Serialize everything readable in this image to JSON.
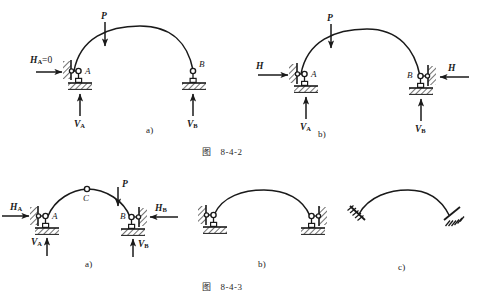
{
  "page": {
    "kind": "engineering-diagram",
    "topic": "arch support reactions",
    "width": 477,
    "height": 299,
    "background": "#ffffff",
    "ink_color": "#1a1a1a"
  },
  "figure_8_4_2": {
    "caption_prefix": "图",
    "caption_number": "8-4-2",
    "panels": [
      {
        "key": "a",
        "panel_label": "a)",
        "description": "two-hinged arch, left support with zero horizontal reaction",
        "load_label": "P",
        "nodes": [
          {
            "name": "A",
            "label": "A"
          },
          {
            "name": "B",
            "label": "B"
          }
        ],
        "reactions": [
          {
            "name": "H_A",
            "base": "H",
            "sub": "A",
            "suffix": "=0",
            "direction": "right"
          },
          {
            "name": "V_A",
            "base": "V",
            "sub": "A",
            "suffix": "",
            "direction": "up"
          },
          {
            "name": "V_B",
            "base": "V",
            "sub": "B",
            "suffix": "",
            "direction": "up"
          }
        ]
      },
      {
        "key": "b",
        "panel_label": "b)",
        "description": "two-hinged arch with horizontal thrust H applied at both abutments",
        "load_label": "P",
        "nodes": [
          {
            "name": "A",
            "label": "A"
          },
          {
            "name": "B",
            "label": "B"
          }
        ],
        "reactions": [
          {
            "name": "H_left",
            "base": "H",
            "sub": "",
            "suffix": "",
            "direction": "right"
          },
          {
            "name": "H_right",
            "base": "H",
            "sub": "",
            "suffix": "",
            "direction": "left"
          },
          {
            "name": "V_A",
            "base": "V",
            "sub": "A",
            "suffix": "",
            "direction": "up"
          },
          {
            "name": "V_B",
            "base": "V",
            "sub": "B",
            "suffix": "",
            "direction": "up"
          }
        ]
      }
    ]
  },
  "figure_8_4_3": {
    "caption_prefix": "图",
    "caption_number": "8-4-3",
    "panels": [
      {
        "key": "a",
        "panel_label": "a)",
        "description": "three-hinged arch with crown hinge C, thrusts and vertical reactions shown",
        "load_label": "P",
        "nodes": [
          {
            "name": "A",
            "label": "A"
          },
          {
            "name": "B",
            "label": "B"
          },
          {
            "name": "C",
            "label": "C"
          }
        ],
        "reactions": [
          {
            "name": "H_A",
            "base": "H",
            "sub": "A",
            "suffix": "",
            "direction": "right"
          },
          {
            "name": "H_B",
            "base": "H",
            "sub": "B",
            "suffix": "",
            "direction": "left"
          },
          {
            "name": "V_A",
            "base": "V",
            "sub": "A",
            "suffix": "",
            "direction": "up"
          },
          {
            "name": "V_B",
            "base": "V",
            "sub": "B",
            "suffix": "",
            "direction": "up"
          }
        ]
      },
      {
        "key": "b",
        "panel_label": "b)",
        "description": "arch on two pinned abutments with horizontal links, no loads shown",
        "load_label": "",
        "nodes": [],
        "reactions": []
      },
      {
        "key": "c",
        "panel_label": "c)",
        "description": "arch with both ends fixed (built-in), hatched fixed supports",
        "load_label": "",
        "nodes": [],
        "reactions": []
      }
    ]
  }
}
